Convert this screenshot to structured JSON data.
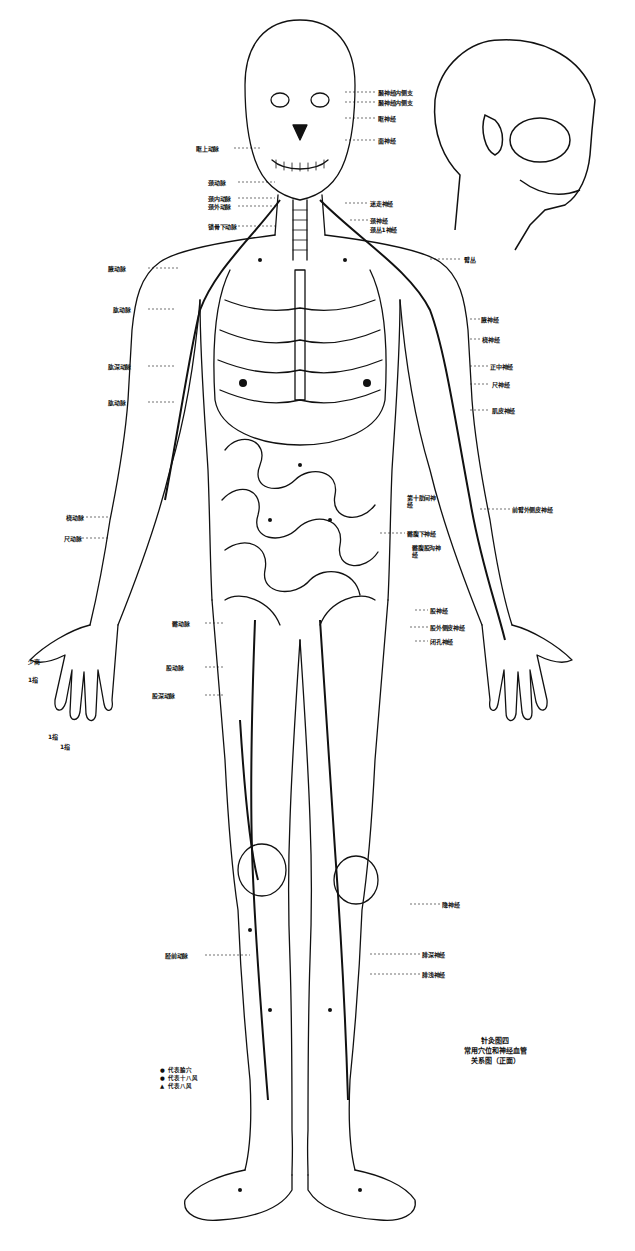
{
  "figure": {
    "title": "针灸图四",
    "subtitle_line1": "常用穴位和神经血管",
    "subtitle_line2": "关系图（正面）",
    "colors": {
      "ink": "#111111",
      "paper": "#ffffff"
    }
  },
  "legend": [
    {
      "symbol": "●",
      "label": "代表腧穴"
    },
    {
      "symbol": "●",
      "label": "代表十八风"
    },
    {
      "symbol": "▲",
      "label": "代表八风"
    }
  ],
  "labels": {
    "head_right": [
      "颞神经内侧支",
      "颞神经内侧支",
      "眶神经",
      "面神经"
    ],
    "head_left": [
      "眶上动脉"
    ],
    "neck_left": [
      "颈动脉",
      "颈内动脉",
      "颈外动脉",
      "锁骨下动脉"
    ],
    "neck_right": [
      "迷走神经",
      "颈神经",
      "颈丛1神经"
    ],
    "shoulder_right": [
      "臂丛"
    ],
    "arm_left": [
      "腋动脉",
      "肱动脉",
      "肱深动脉",
      "肱动脉"
    ],
    "arm_right": [
      "腋神经",
      "桡神经",
      "正中神经",
      "尺神经",
      "肌皮神经"
    ],
    "forearm_left": [
      "桡动脉",
      "尺动脉"
    ],
    "forearm_right": [
      "前臂外侧皮神经"
    ],
    "trunk_right": [
      "第十肋间神经",
      "髂腹下神经",
      "髂腹股沟神经"
    ],
    "pelvis_right": [
      "股神经",
      "股外侧皮神经",
      "闭孔神经"
    ],
    "thigh_left": [
      "髂动脉",
      "股动脉",
      "股深动脉"
    ],
    "leg_right": [
      "隐神经",
      "腓深神经",
      "腓浅神经"
    ],
    "leg_left": [
      "胫前动脉"
    ],
    "hand_left": [
      "少商",
      "1指",
      "1指",
      "1指"
    ]
  }
}
